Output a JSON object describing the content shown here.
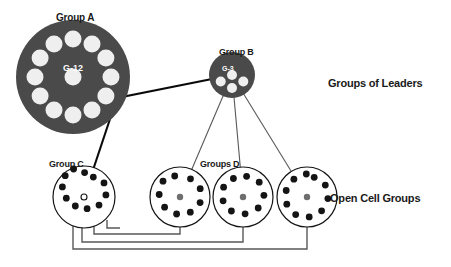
{
  "diagram": {
    "title_labels": {
      "group_a": "Group A",
      "group_b": "Group B",
      "group_c": "Group C",
      "groups_d": "Groups D",
      "right_top": "Groups of Leaders",
      "right_bottom": "Open Cell Groups"
    },
    "inner_captions": {
      "group_a_count": "G-12",
      "group_b_count": "G-3"
    },
    "colors": {
      "dark_fill": "#4a4a4a",
      "node_white": "#efefef",
      "node_black": "#141414",
      "node_gray": "#6e6e6e",
      "outline": "#141414",
      "text": "#1a1a1a",
      "text_inverse": "#ffffff",
      "background": "#ffffff",
      "connector_thin": "#585858",
      "connector_thick": "#0a0a0a"
    },
    "nodes": {
      "group_a": {
        "label": "Group A",
        "cx": 73,
        "cy": 77,
        "r": 57,
        "style": "filled-dark",
        "ring_count": 12,
        "ring_radius": 38,
        "ring_node_r": 8.5,
        "ring_start_deg": -90,
        "center_node_r": 8.5,
        "caption": "G-12"
      },
      "group_b": {
        "label": "Group B",
        "cx": 232,
        "cy": 75,
        "r": 23,
        "style": "filled-dark",
        "ring_count": 3,
        "ring_radius": 13,
        "ring_node_r": 5,
        "ring_start_deg": 30,
        "center_node_r": 5,
        "caption": "G-3"
      },
      "group_c": {
        "label": "Group C",
        "cx": 84,
        "cy": 197,
        "r": 31,
        "style": "outline",
        "ring_count": 11,
        "ring_radius": 22,
        "ring_node_r": 3.4,
        "ring_start_deg": -65,
        "center_node_r": 3.0,
        "center_style": "hollow"
      },
      "groups_d": [
        {
          "label": "Groups D",
          "cx": 180,
          "cy": 197,
          "r": 30,
          "style": "outline",
          "ring_count": 9,
          "ring_radius": 21,
          "ring_node_r": 3.4,
          "ring_start_deg": -60,
          "center_node_r": 3.2,
          "center_style": "gray"
        },
        {
          "label": "Groups D",
          "cx": 243,
          "cy": 197,
          "r": 30,
          "style": "outline",
          "ring_count": 9,
          "ring_radius": 21,
          "ring_node_r": 3.4,
          "ring_start_deg": -80,
          "center_node_r": 3.2,
          "center_style": "gray"
        },
        {
          "label": "Groups D",
          "cx": 307,
          "cy": 197,
          "r": 30,
          "style": "outline",
          "ring_count": 10,
          "ring_radius": 21,
          "ring_node_r": 3.4,
          "ring_start_deg": -70,
          "center_node_r": 3.2,
          "center_style": "gray"
        }
      ]
    },
    "connectors": {
      "a_to_b": "thick line from Group A rim to Group B center",
      "a_to_c": "thick line from Group A rim down to Group C center",
      "b_to_d": "three thin lines from Group B fanning to each Groups D center",
      "feedback_loops": "four nested rectangular return paths from each cell group down and back to Group C"
    }
  }
}
